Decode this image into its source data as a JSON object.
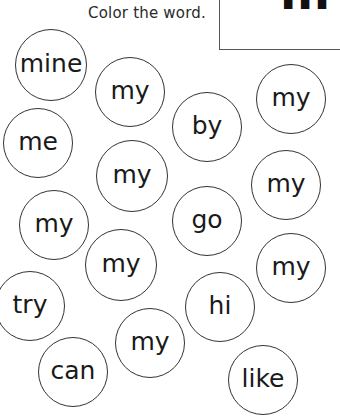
{
  "header": {
    "instruction": "Color the word.",
    "target_word_partial": "m"
  },
  "circles": [
    {
      "word": "mine",
      "cx": 51,
      "cy": 65,
      "r": 36
    },
    {
      "word": "my",
      "cx": 130,
      "cy": 92,
      "r": 35
    },
    {
      "word": "by",
      "cx": 207,
      "cy": 127,
      "r": 35
    },
    {
      "word": "my",
      "cx": 291,
      "cy": 99,
      "r": 35
    },
    {
      "word": "me",
      "cx": 38,
      "cy": 143,
      "r": 35
    },
    {
      "word": "my",
      "cx": 132,
      "cy": 176,
      "r": 36
    },
    {
      "word": "my",
      "cx": 286,
      "cy": 185,
      "r": 35
    },
    {
      "word": "my",
      "cx": 54,
      "cy": 225,
      "r": 35
    },
    {
      "word": "go",
      "cx": 207,
      "cy": 221,
      "r": 35
    },
    {
      "word": "my",
      "cx": 121,
      "cy": 265,
      "r": 36
    },
    {
      "word": "my",
      "cx": 291,
      "cy": 268,
      "r": 35
    },
    {
      "word": "try",
      "cx": 30,
      "cy": 306,
      "r": 35
    },
    {
      "word": "hi",
      "cx": 220,
      "cy": 307,
      "r": 35
    },
    {
      "word": "my",
      "cx": 150,
      "cy": 343,
      "r": 35
    },
    {
      "word": "can",
      "cx": 73,
      "cy": 372,
      "r": 35
    },
    {
      "word": "like",
      "cx": 263,
      "cy": 380,
      "r": 35
    }
  ]
}
